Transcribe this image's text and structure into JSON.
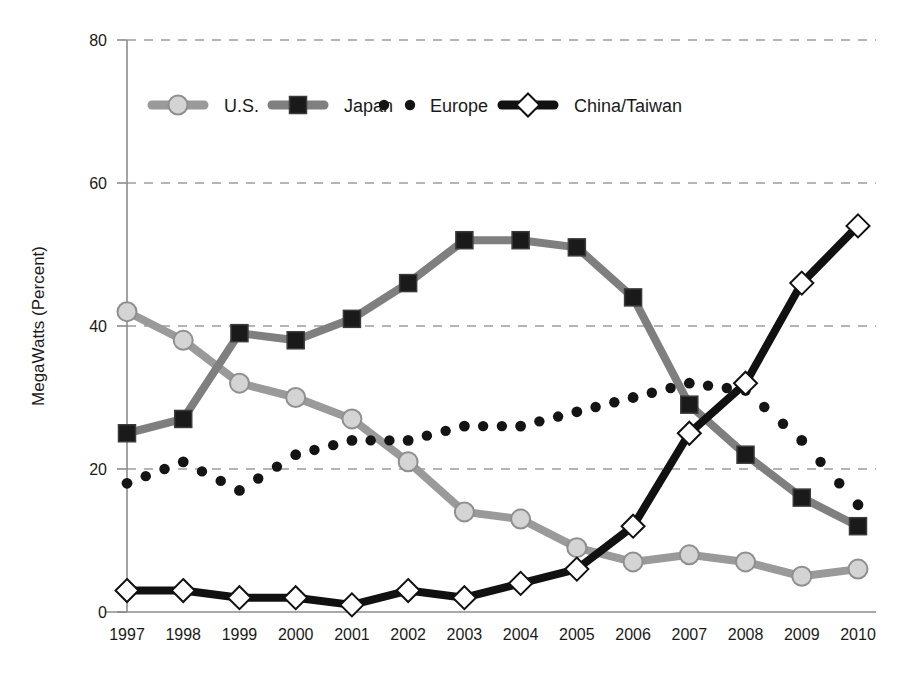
{
  "chart_data": {
    "type": "line",
    "title": "",
    "xlabel": "",
    "ylabel": "MegaWatts (Percent)",
    "categories": [
      "1997",
      "1998",
      "1999",
      "2000",
      "2001",
      "2002",
      "2003",
      "2004",
      "2005",
      "2006",
      "2007",
      "2008",
      "2009",
      "2010"
    ],
    "x": [
      1997,
      1998,
      1999,
      2000,
      2001,
      2002,
      2003,
      2004,
      2005,
      2006,
      2007,
      2008,
      2009,
      2010
    ],
    "ylim": [
      0,
      80
    ],
    "yticks": [
      0,
      20,
      40,
      60,
      80
    ],
    "ytick_labels": [
      "0",
      "20",
      "40",
      "60",
      "80"
    ],
    "grid": "horizontal-dashed",
    "legend_position": "top-inside",
    "series": [
      {
        "name": "U.S.",
        "color": "#9a9a9a",
        "marker": "circle",
        "marker_fill": "#d4d4d4",
        "values": [
          42,
          38,
          32,
          30,
          27,
          21,
          14,
          13,
          9,
          7,
          8,
          7,
          5,
          6
        ]
      },
      {
        "name": "Japan",
        "color": "#7f7f7f",
        "marker": "square",
        "marker_fill": "#1a1a1a",
        "values": [
          25,
          27,
          39,
          38,
          41,
          46,
          52,
          52,
          51,
          44,
          29,
          22,
          16,
          12
        ]
      },
      {
        "name": "Europe",
        "color": "#141414",
        "marker": "dot",
        "marker_fill": "#141414",
        "line_style": "dotted",
        "values": [
          18,
          21,
          17,
          22,
          24,
          24,
          26,
          26,
          28,
          30,
          32,
          31,
          24,
          15
        ]
      },
      {
        "name": "China/Taiwan",
        "color": "#111111",
        "marker": "diamond",
        "marker_fill": "#ffffff",
        "values": [
          3,
          3,
          2,
          2,
          1,
          3,
          2,
          4,
          6,
          12,
          25,
          32,
          46,
          54
        ]
      }
    ]
  },
  "legend": {
    "items": [
      {
        "label": "U.S."
      },
      {
        "label": "Japan"
      },
      {
        "label": "Europe"
      },
      {
        "label": "China/Taiwan"
      }
    ]
  }
}
